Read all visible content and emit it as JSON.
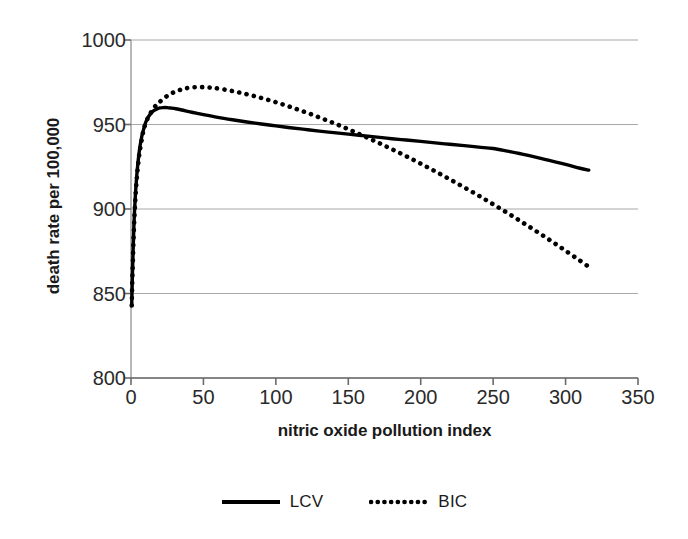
{
  "chart_data": {
    "type": "line",
    "title": "",
    "xlabel": "nitric oxide pollution index",
    "ylabel": "death rate per 100,000",
    "xlim": [
      0,
      350
    ],
    "ylim": [
      800,
      1000
    ],
    "xticks": [
      0,
      50,
      100,
      150,
      200,
      250,
      300,
      350
    ],
    "yticks": [
      800,
      850,
      900,
      950,
      1000
    ],
    "grid": true,
    "grid_axis": "y",
    "grid_color": "#a8a8a8",
    "legend_position": "bottom",
    "series": [
      {
        "name": "LCV",
        "style": "solid",
        "color": "#000000",
        "x": [
          0.5,
          1,
          2,
          3,
          4,
          5,
          6,
          7,
          8,
          9,
          10,
          12,
          14,
          16,
          18,
          20,
          22,
          25,
          28,
          31,
          35,
          40,
          45,
          50,
          60,
          70,
          80,
          90,
          100,
          110,
          120,
          130,
          140,
          150,
          160,
          170,
          180,
          190,
          200,
          210,
          220,
          230,
          240,
          250,
          260,
          270,
          280,
          290,
          300,
          310,
          316
        ],
        "y": [
          843,
          862,
          890,
          908,
          920,
          929,
          936,
          941,
          945,
          948,
          951,
          954.5,
          956.8,
          958.3,
          959.2,
          959.8,
          960.0,
          960.0,
          959.7,
          959.3,
          958.6,
          957.6,
          956.7,
          955.8,
          954.2,
          952.8,
          951.5,
          950.3,
          949.2,
          948.1,
          947.1,
          946.1,
          945.2,
          944.3,
          943.4,
          942.5,
          941.6,
          940.8,
          940.0,
          939.1,
          938.3,
          937.5,
          936.6,
          935.8,
          934.2,
          932.5,
          930.6,
          928.5,
          926.4,
          924.1,
          923.0
        ]
      },
      {
        "name": "BIC",
        "style": "dotted",
        "color": "#000000",
        "x": [
          0.5,
          1,
          2,
          3,
          4,
          5,
          6,
          7,
          8,
          9,
          10,
          12,
          14,
          16,
          18,
          20,
          24,
          28,
          32,
          36,
          40,
          45,
          50,
          55,
          60,
          70,
          80,
          90,
          100,
          110,
          120,
          130,
          140,
          150,
          160,
          170,
          180,
          190,
          200,
          210,
          220,
          230,
          240,
          250,
          260,
          270,
          280,
          290,
          300,
          310,
          316
        ],
        "y": [
          843,
          861,
          888,
          906,
          918,
          927,
          934,
          939,
          944,
          947.5,
          950.5,
          954.5,
          957.5,
          960,
          962,
          963.5,
          966.3,
          968.4,
          969.9,
          971.0,
          971.7,
          972.1,
          972.1,
          971.8,
          971.3,
          969.8,
          967.9,
          965.7,
          963.2,
          960.4,
          957.4,
          954.2,
          950.8,
          947.2,
          943.4,
          939.5,
          935.4,
          931.2,
          926.8,
          922.3,
          917.6,
          912.8,
          907.9,
          902.8,
          897.6,
          892.2,
          886.7,
          881.1,
          875.3,
          869.4,
          865.8
        ]
      }
    ]
  },
  "legend": {
    "entries": [
      {
        "label": "LCV",
        "style": "solid"
      },
      {
        "label": "BIC",
        "style": "dotted"
      }
    ]
  },
  "axes": {
    "x_title": "nitric oxide pollution index",
    "y_title": "death rate per 100,000",
    "x_tick_labels": [
      "0",
      "50",
      "100",
      "150",
      "200",
      "250",
      "300",
      "350"
    ],
    "y_tick_labels": [
      "800",
      "850",
      "900",
      "950",
      "1000"
    ]
  }
}
